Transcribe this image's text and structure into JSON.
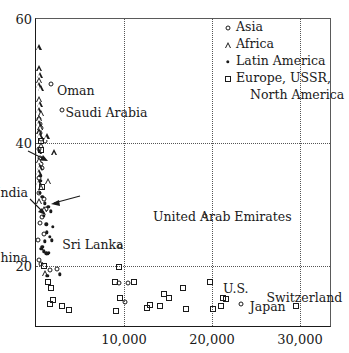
{
  "chart_data": {
    "type": "scatter",
    "title": "",
    "xlabel": "",
    "ylabel": "",
    "xlim": [
      0,
      33636
    ],
    "ylim": [
      10,
      60
    ],
    "xticks": [
      10000,
      20000,
      30000
    ],
    "xticklabels": [
      "10,000",
      "20,000",
      "30,000"
    ],
    "yticks": [
      20,
      40,
      60
    ],
    "yticklabels": [
      "20",
      "40",
      "60"
    ],
    "grid": "dotted gridlines at y = 20 and y = 40, and x = 10,000 / 20,000 / 30,000",
    "legend_position": "top-right inside axes",
    "legend": [
      {
        "marker": "open-circle",
        "label": "Asia"
      },
      {
        "marker": "open-triangle",
        "label": "Africa"
      },
      {
        "marker": "filled-dot",
        "label": "Latin America"
      },
      {
        "marker": "open-square",
        "label": "Europe, USSR,",
        "label2": "North America"
      }
    ],
    "annotations": [
      {
        "text": "Oman",
        "x": 1700,
        "y": 49.5
      },
      {
        "text": "Saudi Arabia",
        "x": 2900,
        "y": 46.0
      },
      {
        "text": "India",
        "x": 0,
        "y": 33.0
      },
      {
        "text": "China",
        "x": 0,
        "y": 22.5
      },
      {
        "text": "Sri Lanka",
        "x": 2300,
        "y": 24.5
      },
      {
        "text": "United Arab Emirates",
        "x": 19200,
        "y": 28.5
      },
      {
        "text": "U.S.",
        "x": 20800,
        "y": 17.5
      },
      {
        "text": "Japan",
        "x": 23600,
        "y": 14.5
      },
      {
        "text": "Switzerland",
        "x": 29600,
        "y": 16.0
      }
    ],
    "series": [
      {
        "name": "Asia",
        "marker": "open-circle",
        "points": [
          [
            330,
            43.8
          ],
          [
            400,
            43.0
          ],
          [
            520,
            42.3
          ],
          [
            470,
            41.5
          ],
          [
            600,
            40.6
          ],
          [
            1020,
            40.2
          ],
          [
            350,
            39.0
          ],
          [
            430,
            37.5
          ],
          [
            560,
            36.5
          ],
          [
            640,
            35.9
          ],
          [
            380,
            34.3
          ],
          [
            300,
            31.8
          ],
          [
            900,
            30.8
          ],
          [
            1150,
            29.2
          ],
          [
            700,
            27.9
          ],
          [
            420,
            27.0
          ],
          [
            1700,
            49.5
          ],
          [
            2900,
            45.2
          ],
          [
            330,
            21.0
          ],
          [
            560,
            20.3
          ],
          [
            1550,
            19.4
          ],
          [
            2400,
            19.5
          ],
          [
            9600,
            23.3
          ],
          [
            9400,
            17.3
          ],
          [
            10500,
            17.3
          ],
          [
            10100,
            14.2
          ],
          [
            19200,
            28.2
          ],
          [
            23300,
            13.9
          ],
          [
            250,
            24.2
          ],
          [
            880,
            25.2
          ]
        ]
      },
      {
        "name": "Africa",
        "marker": "open-triangle",
        "points": [
          [
            300,
            55.4
          ],
          [
            330,
            52.0
          ],
          [
            420,
            51.0
          ],
          [
            380,
            50.2
          ],
          [
            300,
            49.3
          ],
          [
            520,
            48.8
          ],
          [
            350,
            47.0
          ],
          [
            430,
            46.2
          ],
          [
            300,
            45.3
          ],
          [
            560,
            44.8
          ],
          [
            380,
            44.0
          ],
          [
            300,
            43.2
          ],
          [
            480,
            42.5
          ],
          [
            330,
            41.8
          ],
          [
            420,
            41.2
          ],
          [
            1200,
            41.0
          ],
          [
            2100,
            38.4
          ],
          [
            620,
            39.6
          ],
          [
            300,
            38.6
          ],
          [
            350,
            37.2
          ],
          [
            430,
            36.0
          ],
          [
            300,
            35.2
          ],
          [
            1400,
            33.8
          ],
          [
            620,
            32.8
          ],
          [
            900,
            29.2
          ],
          [
            1050,
            18.9
          ],
          [
            300,
            33.6
          ],
          [
            380,
            30.5
          ]
        ]
      },
      {
        "name": "Latin America",
        "marker": "filled-dot",
        "points": [
          [
            560,
            33.8
          ],
          [
            700,
            31.2
          ],
          [
            1020,
            30.2
          ],
          [
            1400,
            29.6
          ],
          [
            1700,
            28.9
          ],
          [
            900,
            28.2
          ],
          [
            1150,
            26.8
          ],
          [
            1900,
            26.4
          ],
          [
            1250,
            25.5
          ],
          [
            1600,
            24.8
          ],
          [
            420,
            31.9
          ],
          [
            1020,
            24.0
          ],
          [
            700,
            23.1
          ],
          [
            900,
            22.4
          ],
          [
            1150,
            22.1
          ],
          [
            1280,
            22.0
          ],
          [
            1450,
            22.2
          ],
          [
            620,
            22.8
          ],
          [
            1300,
            18.4
          ],
          [
            2700,
            18.7
          ],
          [
            480,
            34.6
          ],
          [
            1800,
            24.2
          ]
        ]
      },
      {
        "name": "Europe, USSR, North America",
        "marker": "open-square",
        "points": [
          [
            560,
            40.2
          ],
          [
            620,
            38.8
          ],
          [
            700,
            32.8
          ],
          [
            900,
            20.0
          ],
          [
            1400,
            17.5
          ],
          [
            1700,
            16.4
          ],
          [
            1900,
            14.6
          ],
          [
            1600,
            13.9
          ],
          [
            2900,
            13.6
          ],
          [
            3800,
            12.9
          ],
          [
            9400,
            19.8
          ],
          [
            9000,
            17.4
          ],
          [
            11100,
            17.4
          ],
          [
            9500,
            14.8
          ],
          [
            9100,
            12.8
          ],
          [
            14500,
            15.5
          ],
          [
            15100,
            14.8
          ],
          [
            13000,
            13.8
          ],
          [
            14100,
            13.6
          ],
          [
            16700,
            16.4
          ],
          [
            17000,
            13.0
          ],
          [
            19800,
            17.5
          ],
          [
            21200,
            14.9
          ],
          [
            21600,
            14.7
          ],
          [
            21000,
            13.6
          ],
          [
            20100,
            13.1
          ],
          [
            29600,
            13.5
          ],
          [
            12600,
            13.2
          ]
        ]
      }
    ]
  }
}
